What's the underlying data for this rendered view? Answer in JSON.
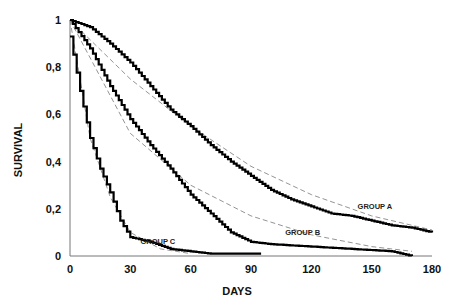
{
  "chart_data": {
    "type": "line",
    "title": "",
    "xlabel": "DAYS",
    "ylabel": "SURVIVAL",
    "xlim": [
      0,
      180
    ],
    "ylim": [
      0,
      1
    ],
    "xticks": [
      "0",
      "30",
      "60",
      "90",
      "120",
      "150",
      "180"
    ],
    "yticks": [
      "0",
      "0,2",
      "0,4",
      "0,6",
      "0,8",
      "1"
    ],
    "grid": false,
    "legend": "inline labels",
    "series": [
      {
        "name": "GROUP A",
        "style": "step (Kaplan-Meier), thick solid black",
        "x": [
          0,
          10,
          20,
          30,
          40,
          50,
          60,
          70,
          80,
          90,
          100,
          110,
          120,
          130,
          140,
          150,
          160,
          170,
          180
        ],
        "values": [
          1.0,
          0.97,
          0.9,
          0.82,
          0.72,
          0.62,
          0.55,
          0.47,
          0.4,
          0.34,
          0.28,
          0.24,
          0.21,
          0.18,
          0.17,
          0.15,
          0.13,
          0.12,
          0.1
        ]
      },
      {
        "name": "GROUP B",
        "style": "step (Kaplan-Meier), thick solid black",
        "x": [
          0,
          10,
          20,
          30,
          40,
          50,
          60,
          70,
          80,
          90,
          100,
          120,
          140,
          160,
          170
        ],
        "values": [
          1.0,
          0.88,
          0.72,
          0.58,
          0.47,
          0.37,
          0.26,
          0.18,
          0.1,
          0.06,
          0.05,
          0.04,
          0.03,
          0.02,
          0.0
        ]
      },
      {
        "name": "GROUP C",
        "style": "step (Kaplan-Meier), thick solid black",
        "x": [
          0,
          5,
          10,
          15,
          20,
          25,
          30,
          40,
          50,
          60,
          70,
          95
        ],
        "values": [
          0.93,
          0.7,
          0.5,
          0.37,
          0.27,
          0.15,
          0.08,
          0.06,
          0.03,
          0.02,
          0.01,
          0.01
        ]
      }
    ],
    "fitted_curves": [
      {
        "name": "GROUP A fit",
        "style": "dashed gray",
        "x": [
          0,
          30,
          60,
          90,
          120,
          150,
          180
        ],
        "values": [
          1.0,
          0.75,
          0.55,
          0.38,
          0.26,
          0.17,
          0.11
        ]
      },
      {
        "name": "GROUP B fit",
        "style": "dashed gray",
        "x": [
          0,
          30,
          60,
          90,
          120,
          150,
          170
        ],
        "values": [
          1.0,
          0.52,
          0.3,
          0.17,
          0.09,
          0.04,
          0.02
        ]
      },
      {
        "name": "GROUP C fit",
        "style": "dashed gray",
        "x": [
          0,
          10,
          20,
          30,
          45,
          60
        ],
        "values": [
          1.0,
          0.5,
          0.25,
          0.1,
          0.03,
          0.01
        ]
      }
    ],
    "annotations": [
      {
        "text": "GROUP A",
        "x": 143,
        "y": 0.2
      },
      {
        "text": "GROUP B",
        "x": 107,
        "y": 0.09
      },
      {
        "text": "GROUP C",
        "x": 35,
        "y": 0.05
      }
    ]
  }
}
